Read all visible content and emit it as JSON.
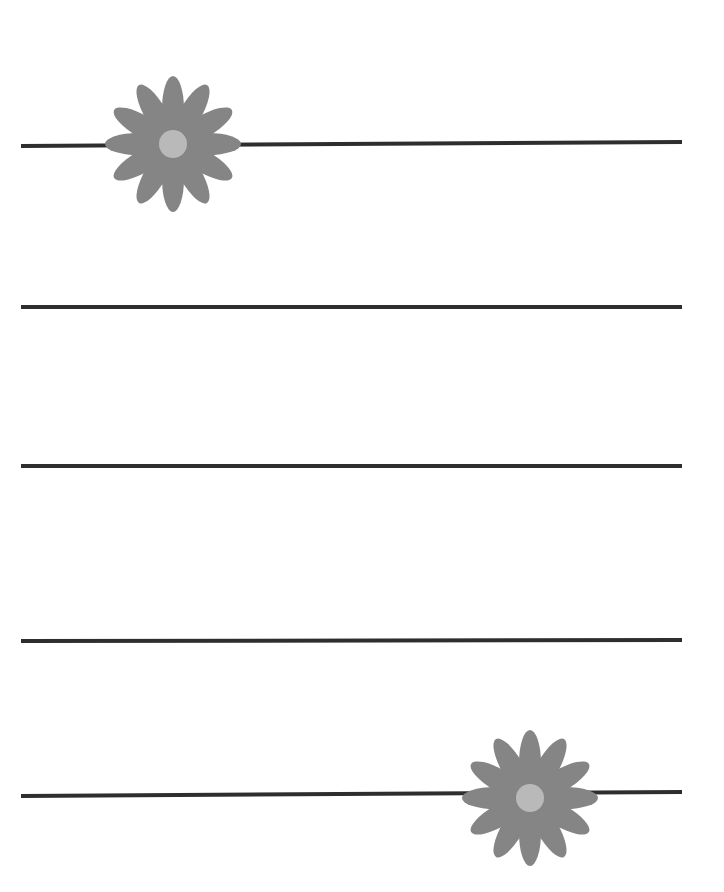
{
  "page": {
    "width": 724,
    "height": 892,
    "background": "#ffffff"
  },
  "colors": {
    "line": "#2e2e2e",
    "petal": "#858585",
    "flower_center": "#b9b9b9"
  },
  "ruled_lines": [
    {
      "x1": 21,
      "y1": 146,
      "x2": 682,
      "y2": 142
    },
    {
      "x1": 21,
      "y1": 307,
      "x2": 682,
      "y2": 307
    },
    {
      "x1": 21,
      "y1": 466,
      "x2": 682,
      "y2": 466
    },
    {
      "x1": 21,
      "y1": 641,
      "x2": 682,
      "y2": 640
    },
    {
      "x1": 21,
      "y1": 796,
      "x2": 682,
      "y2": 792
    }
  ],
  "flowers": [
    {
      "icon": "daisy-icon",
      "cx": 173,
      "cy": 144,
      "petal_count": 12,
      "petal_length": 68,
      "petal_width": 22,
      "center_radius": 14
    },
    {
      "icon": "daisy-icon",
      "cx": 530,
      "cy": 798,
      "petal_count": 12,
      "petal_length": 68,
      "petal_width": 22,
      "center_radius": 14
    }
  ]
}
